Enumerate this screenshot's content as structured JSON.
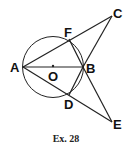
{
  "figure": {
    "caption": "Ex. 28",
    "points": {
      "A": {
        "label": "A",
        "x": 23,
        "y": 67
      },
      "B": {
        "label": "B",
        "x": 83,
        "y": 67
      },
      "C": {
        "label": "C",
        "x": 112,
        "y": 16
      },
      "D": {
        "label": "D",
        "x": 69,
        "y": 95
      },
      "E": {
        "label": "E",
        "x": 112,
        "y": 122
      },
      "F": {
        "label": "F",
        "x": 69,
        "y": 39
      },
      "O": {
        "label": "O",
        "x": 53,
        "y": 67
      }
    },
    "circle": {
      "center": "O",
      "radius": 30.5
    },
    "segments": [
      "AB",
      "AC",
      "AE",
      "BC",
      "BE",
      "BF",
      "BD"
    ]
  }
}
